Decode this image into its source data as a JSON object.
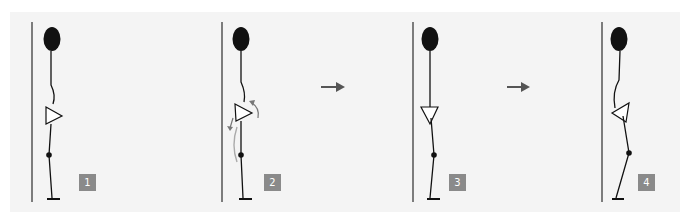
{
  "figure": {
    "panels": [
      {
        "step": "1",
        "label": "1"
      },
      {
        "step": "2",
        "label": "2"
      },
      {
        "step": "3",
        "label": "3"
      },
      {
        "step": "4",
        "label": "4"
      }
    ],
    "arrows": [
      "right-arrow",
      "right-arrow"
    ],
    "colors": {
      "background": "#f4f4f4",
      "wall": "#555555",
      "figure": "#111111",
      "badge": "#8a8a8a",
      "badge_text": "#ffffff",
      "arrow": "#555555",
      "motion_arrow": "#9a9a9a"
    }
  }
}
